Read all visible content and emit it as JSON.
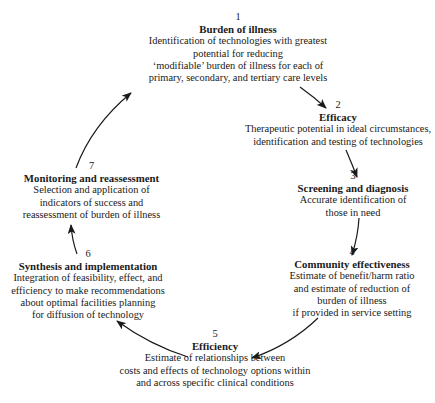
{
  "diagram": {
    "type": "cycle",
    "nodes": [
      {
        "number": "1",
        "title": "Burden of illness",
        "lines": [
          "Identification of technologies with greatest",
          "potential for reducing",
          "‘modifiable’ burden of illness for each of",
          "primary, secondary, and tertiary care levels"
        ]
      },
      {
        "number": "2",
        "title": "Efficacy",
        "lines": [
          "Therapeutic potential in ideal circumstances,",
          "identification and testing of technologies"
        ]
      },
      {
        "number": "3",
        "title": "Screening and diagnosis",
        "lines": [
          "Accurate identification of",
          "those in need"
        ]
      },
      {
        "number": "4",
        "title": "Community effectiveness",
        "lines": [
          "Estimate of benefit/harm ratio",
          "and estimate of reduction of",
          "burden of illness",
          "if provided in service setting"
        ]
      },
      {
        "number": "5",
        "title": "Efficiency",
        "lines": [
          "Estimate of relationships between",
          "costs and effects of technology options within",
          "and across specific clinical conditions"
        ]
      },
      {
        "number": "6",
        "title": "Synthesis and implementation",
        "lines": [
          "Integration of feasibility, effect, and",
          "efficiency to make recommendations",
          "about optimal facilities planning",
          "for diffusion of technology"
        ]
      },
      {
        "number": "7",
        "title": "Monitoring and reassessment",
        "lines": [
          "Selection and application of",
          "indicators of success and",
          "reassessment of burden of illness"
        ]
      }
    ],
    "edges": [
      {
        "from": "1",
        "to": "2"
      },
      {
        "from": "2",
        "to": "3"
      },
      {
        "from": "3",
        "to": "4"
      },
      {
        "from": "4",
        "to": "5"
      },
      {
        "from": "5",
        "to": "6"
      },
      {
        "from": "6",
        "to": "7"
      },
      {
        "from": "7",
        "to": "1"
      }
    ],
    "colors": {
      "text": "#1a1a1a",
      "arrow": "#1a1a1a",
      "background": "#ffffff"
    }
  }
}
